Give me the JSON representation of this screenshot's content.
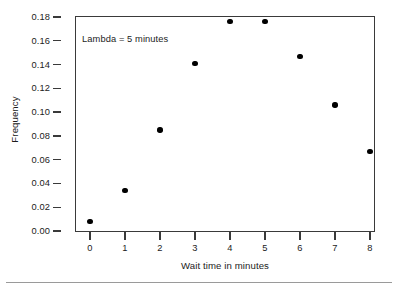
{
  "chart_data": {
    "type": "scatter",
    "title": "",
    "subtitle": "",
    "xlabel": "Wait time in minutes",
    "ylabel": "Frequency",
    "x": [
      0,
      1,
      2,
      3,
      4,
      5,
      6,
      7,
      8
    ],
    "values": [
      0.008,
      0.034,
      0.085,
      0.141,
      0.176,
      0.176,
      0.147,
      0.106,
      0.067
    ],
    "series": [
      {
        "name": "Frequency",
        "x": [
          0,
          1,
          2,
          3,
          4,
          5,
          6,
          7,
          8
        ],
        "values": [
          0.008,
          0.034,
          0.085,
          0.141,
          0.176,
          0.176,
          0.147,
          0.106,
          0.067
        ]
      }
    ],
    "xlim": [
      -0.45,
      8.45
    ],
    "ylim": [
      0.0,
      0.19
    ],
    "xticks": [
      0,
      1,
      2,
      3,
      4,
      5,
      6,
      7,
      8
    ],
    "xtick_labels": [
      "0",
      "1",
      "2",
      "3",
      "4",
      "5",
      "6",
      "7",
      "8"
    ],
    "yticks": [
      0.0,
      0.02,
      0.04,
      0.06,
      0.08,
      0.1,
      0.12,
      0.14,
      0.16,
      0.18
    ],
    "ytick_labels": [
      "0.00",
      "0.02",
      "0.04",
      "0.06",
      "0.08",
      "0.10",
      "0.12",
      "0.14",
      "0.16",
      "0.18"
    ],
    "grid": false,
    "legend": null,
    "legend_position": "none",
    "annotations": [
      {
        "text": "Lambda = 5 minutes",
        "x": 0.25,
        "y": 0.168
      }
    ],
    "marker": "filled-circle",
    "marker_color": "#000000",
    "frame_color": "#3a3a3a",
    "background": "#ffffff"
  }
}
